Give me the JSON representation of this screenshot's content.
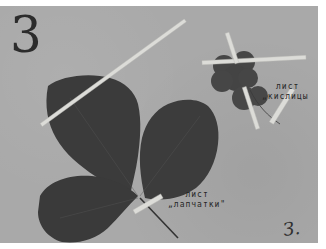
{
  "sheet": {
    "number": "3",
    "background_color": "#a9a9a9",
    "leaf_color": "#3a3a3a",
    "tape_color": "#dcdcd8"
  },
  "specimens": [
    {
      "name": "potentilla-leaf",
      "label_line1": "лист",
      "label_line2": "„лапчатки\""
    },
    {
      "name": "oxalis-leaf",
      "label_line1": "лист",
      "label_line2": "„кислицы"
    }
  ],
  "signature": "З."
}
